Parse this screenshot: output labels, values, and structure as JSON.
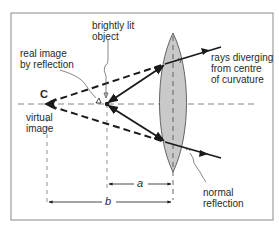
{
  "diagram": {
    "type": "optics-ray-diagram",
    "labels": {
      "object": "brightly lit\nobject",
      "real_image": "real image\nby reflection",
      "center": "C",
      "virtual_image": "virtual\nimage",
      "rays": "rays diverging\nfrom centre\nof curvature",
      "normal": "normal\nreflection",
      "dim_a": "a",
      "dim_b": "b"
    },
    "colors": {
      "line": "#1a1a1a",
      "lens_fill": "#c9c9c9",
      "frame": "#888888",
      "text": "#2a2a2a"
    }
  }
}
